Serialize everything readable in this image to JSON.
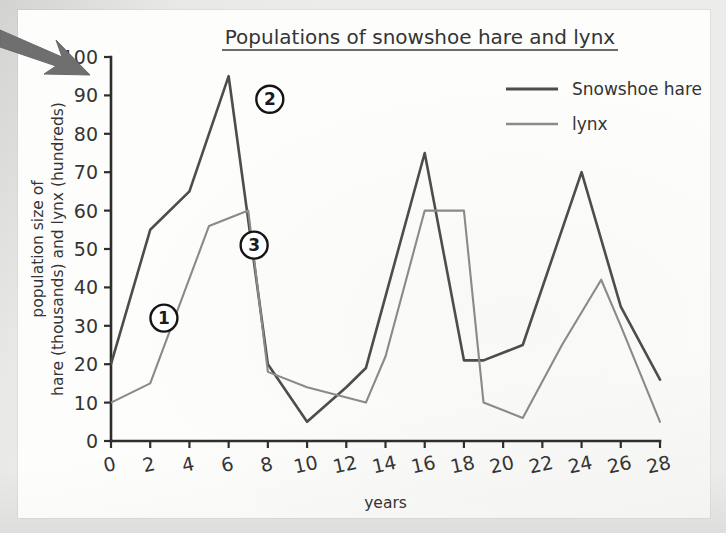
{
  "document": {
    "kind": "textbook-figure-scan",
    "paper_color": "#fdfdfc",
    "background_color": "#ececeb"
  },
  "overlay": {
    "arrow": {
      "icon": "arrow-right-down-icon",
      "color": "#6e6e6e",
      "label": "pointer annotation arrow"
    }
  },
  "chart_data": {
    "type": "line",
    "title": "Populations of snowshoe hare and lynx",
    "title_underlined": true,
    "xlabel": "years",
    "ylabel": "population size of\nhare (thousands) and lynx (hundreds)",
    "ylabel_lines": [
      "population size of",
      "hare (thousands) and lynx (hundreds)"
    ],
    "xlim": [
      0,
      28
    ],
    "ylim": [
      0,
      100
    ],
    "xticks": [
      0,
      2,
      4,
      6,
      8,
      10,
      12,
      14,
      16,
      18,
      20,
      22,
      24,
      26,
      28
    ],
    "yticks": [
      0,
      10,
      20,
      30,
      40,
      50,
      60,
      70,
      80,
      90,
      100
    ],
    "xtick_labels": [
      "0",
      "2",
      "4",
      "6",
      "8",
      "10",
      "12",
      "14",
      "16",
      "18",
      "20",
      "22",
      "24",
      "26",
      "28"
    ],
    "ytick_labels": [
      "0",
      "10",
      "20",
      "30",
      "40",
      "50",
      "60",
      "70",
      "80",
      "90",
      "100"
    ],
    "grid": false,
    "legend_position": "top-right",
    "series": [
      {
        "name": "Snowshoe hare",
        "color": "#4d4d4d",
        "line_width": 2.6,
        "points": [
          [
            0,
            20
          ],
          [
            2,
            55
          ],
          [
            4,
            65
          ],
          [
            6,
            95
          ],
          [
            8,
            20
          ],
          [
            10,
            5
          ],
          [
            12,
            14
          ],
          [
            13,
            19
          ],
          [
            16,
            75
          ],
          [
            18,
            21
          ],
          [
            19,
            21
          ],
          [
            21,
            25
          ],
          [
            24,
            70
          ],
          [
            26,
            35
          ],
          [
            28,
            16
          ]
        ]
      },
      {
        "name": "lynx",
        "color": "#8a8a8a",
        "line_width": 2.1,
        "points": [
          [
            0,
            10
          ],
          [
            2,
            15
          ],
          [
            5,
            56
          ],
          [
            7,
            60
          ],
          [
            8,
            18
          ],
          [
            10,
            14
          ],
          [
            13,
            10
          ],
          [
            14,
            22
          ],
          [
            16,
            60
          ],
          [
            18,
            60
          ],
          [
            19,
            10
          ],
          [
            21,
            6
          ],
          [
            23,
            25
          ],
          [
            25,
            42
          ],
          [
            26,
            30
          ],
          [
            28,
            5
          ]
        ]
      }
    ],
    "annotations": [
      {
        "label": "1",
        "x": 2.7,
        "y": 32,
        "shape": "circled-number"
      },
      {
        "label": "2",
        "x": 8.1,
        "y": 89,
        "shape": "circled-number"
      },
      {
        "label": "3",
        "x": 7.3,
        "y": 51,
        "shape": "circled-number"
      }
    ]
  }
}
